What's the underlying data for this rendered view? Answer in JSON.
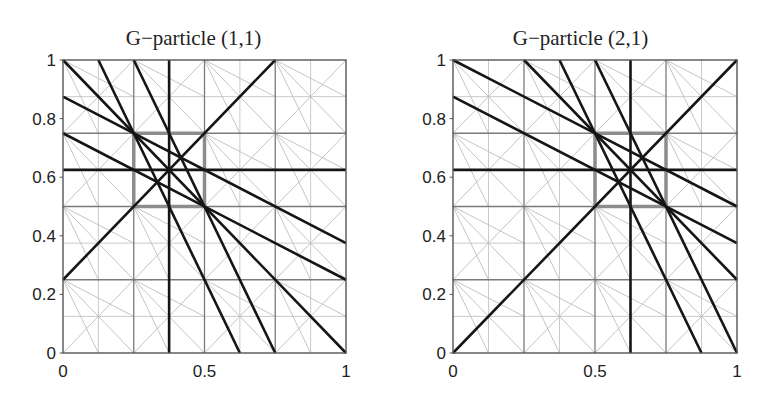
{
  "figure": {
    "panels": [
      {
        "title": "G−particle (1,1)",
        "xticks": [
          "0",
          "0.5",
          "1"
        ],
        "yticks": [
          "0",
          "0.2",
          "0.4",
          "0.6",
          "0.8",
          "1"
        ],
        "highlight_box": {
          "x0": 0.25,
          "x1": 0.5,
          "y0": 0.5,
          "y1": 0.75
        },
        "lines": [
          [
            0.375,
            0,
            0.375,
            1
          ],
          [
            0,
            0.625,
            1,
            0.625
          ],
          [
            0,
            0.25,
            0.75,
            1
          ],
          [
            0,
            1,
            1,
            0
          ],
          [
            0,
            0.875,
            1,
            0.375
          ],
          [
            0,
            0.75,
            1,
            0.25
          ],
          [
            0.125,
            1,
            0.625,
            0
          ],
          [
            0.25,
            1,
            0.75,
            0
          ]
        ]
      },
      {
        "title": "G−particle (2,1)",
        "xticks": [
          "0",
          "0.5",
          "1"
        ],
        "yticks": [
          "0",
          "0.2",
          "0.4",
          "0.6",
          "0.8",
          "1"
        ],
        "highlight_box": {
          "x0": 0.5,
          "x1": 0.75,
          "y0": 0.5,
          "y1": 0.75
        },
        "lines": [
          [
            0.625,
            0,
            0.625,
            1
          ],
          [
            0,
            0.625,
            1,
            0.625
          ],
          [
            0,
            0,
            1,
            1
          ],
          [
            0,
            1,
            1,
            0.5
          ],
          [
            0,
            0.875,
            1,
            0.375
          ],
          [
            0.25,
            1,
            1,
            0.25
          ],
          [
            0.375,
            1,
            0.875,
            0
          ],
          [
            0.5,
            1,
            1,
            0
          ]
        ]
      }
    ],
    "colors": {
      "mesh_fine": "#bdbdbd",
      "mesh_coarse": "#7a7a7a",
      "highlight_box": "#8c8c8c",
      "particle_lines": "#151515"
    }
  }
}
